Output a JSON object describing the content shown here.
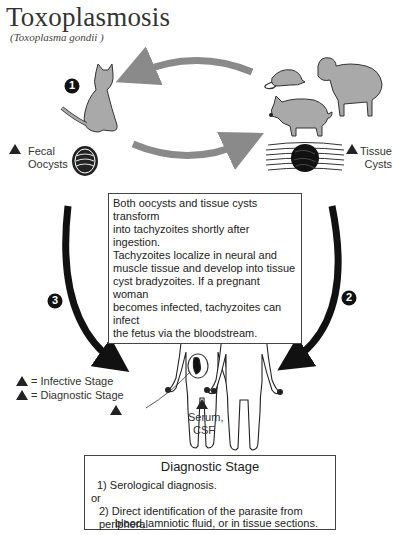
{
  "header": {
    "title": "Toxoplasmosis",
    "subtitle": "(Toxoplasma gondii )"
  },
  "steps": {
    "step1": "1",
    "step2": "2",
    "step3": "3"
  },
  "labels": {
    "fecal_oocysts_line1": "Fecal",
    "fecal_oocysts_line2": "Oocysts",
    "tissue_cysts_line1": "Tissue",
    "tissue_cysts_line2": "Cysts",
    "serum_line1": "Serum,",
    "serum_line2": "CSF",
    "stage_marker_infective": "i",
    "stage_marker_diagnostic": "d"
  },
  "info_box": {
    "lines": [
      "Both oocysts and tissue cysts transform",
      "into tachyzoites shortly after ingestion.",
      "Tachyzoites localize in neural and",
      "muscle tissue and develop into tissue",
      "cyst bradyzoites. If a pregnant woman",
      "becomes infected, tachyzoites can infect",
      "the fetus via the bloodstream."
    ]
  },
  "legend": {
    "infective": "= Infective Stage",
    "diagnostic": "= Diagnostic Stage"
  },
  "diagnostic_box": {
    "heading": "Diagnostic Stage",
    "item1": "1) Serological diagnosis.",
    "or": "or",
    "item2_line1": "2) Direct identification of the parasite from peripheral",
    "item2_line2": "blood, amniotic fluid, or in tissue sections."
  },
  "colors": {
    "animal_fill": "#a9a9a9",
    "gray_arrow": "#8a8a8a",
    "black_arrow": "#111111",
    "outline": "#333333"
  }
}
